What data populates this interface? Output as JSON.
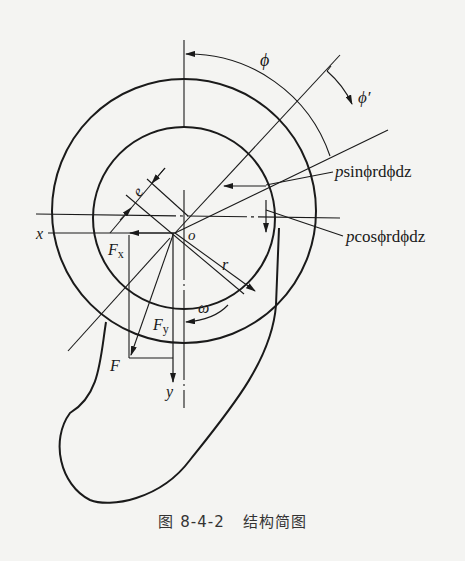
{
  "figure": {
    "caption_number": "图 8-4-2",
    "caption_title": "结构简图"
  },
  "labels": {
    "phi": "ϕ",
    "phi_prime": "ϕ′",
    "p_sin": "psinϕrdϕdz",
    "p_sin_p": "p",
    "p_sin_rest": "sinϕrdϕdz",
    "p_cos_p": "p",
    "p_cos_rest": "cosϕrdϕdz",
    "e": "e",
    "x": "x",
    "o": "o",
    "Fx": "F",
    "Fx_sub": "x",
    "r": "r",
    "omega": "ω",
    "Fy": "F",
    "Fy_sub": "y",
    "F": "F",
    "y": "y"
  },
  "colors": {
    "background": "#f4f4f2",
    "ink": "#1a1a1a"
  }
}
